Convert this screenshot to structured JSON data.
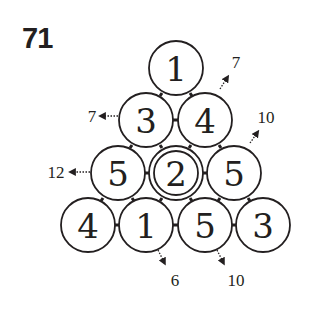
{
  "puzzle": {
    "number": "71",
    "rows": [
      [
        "1"
      ],
      [
        "3",
        "4"
      ],
      [
        "5",
        "2",
        "5"
      ],
      [
        "4",
        "1",
        "5",
        "3"
      ]
    ],
    "highlighted_cell": {
      "row": 2,
      "col": 1
    },
    "hints": {
      "left_row2": "7",
      "left_row3": "12",
      "right_row1": "7",
      "right_row2": "10",
      "bottom_diag1": "6",
      "bottom_diag2": "10"
    }
  }
}
